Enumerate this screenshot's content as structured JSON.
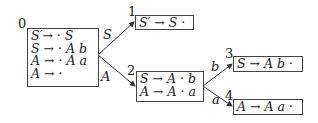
{
  "diagram": {
    "type": "LR(0) automaton",
    "states": [
      {
        "id": "0",
        "items": [
          "S′→ · S",
          "S → · A b",
          "A → · A a",
          "A → ·"
        ]
      },
      {
        "id": "1",
        "items": [
          "S′ → S ·"
        ]
      },
      {
        "id": "2",
        "items": [
          "S → A · b",
          "A → A · a"
        ]
      },
      {
        "id": "3",
        "items": [
          "S → A b ·"
        ]
      },
      {
        "id": "4",
        "items": [
          "A → A a ·"
        ]
      }
    ],
    "edges": [
      {
        "from": "0",
        "to": "1",
        "label": "S"
      },
      {
        "from": "0",
        "to": "2",
        "label": "A"
      },
      {
        "from": "2",
        "to": "3",
        "label": "b"
      },
      {
        "from": "2",
        "to": "4",
        "label": "a"
      }
    ]
  }
}
